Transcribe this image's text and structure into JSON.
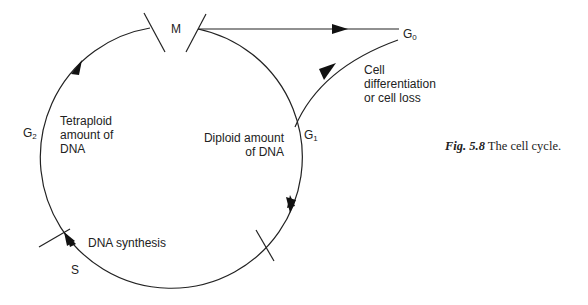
{
  "diagram": {
    "title": "The cell cycle",
    "phases": {
      "M": "M",
      "G0": {
        "letter": "G",
        "sub": "0"
      },
      "G1": {
        "letter": "G",
        "sub": "1"
      },
      "G2": {
        "letter": "G",
        "sub": "2"
      },
      "S": "S"
    },
    "annotations": {
      "tetraploid": [
        "Tetraploid",
        "amount of",
        "DNA"
      ],
      "diploid": [
        "Diploid amount",
        "of DNA"
      ],
      "differentiation": [
        "Cell",
        "differentiation",
        "or cell loss"
      ],
      "synthesis": "DNA synthesis"
    }
  },
  "caption": {
    "fig_label": "Fig. 5.8",
    "text": "The cell cycle."
  }
}
